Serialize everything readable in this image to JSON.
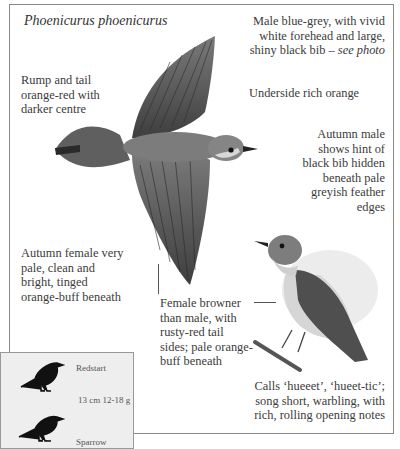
{
  "title": "Phoenicurus phoenicurus",
  "annotations": {
    "rump": [
      "Rump and tail",
      "orange-red with",
      "darker centre"
    ],
    "male": {
      "lines": [
        "Male blue-grey, with vivid",
        "white forehead and large,"
      ],
      "last_line": "shiny black bib – ",
      "see_photo": "see photo"
    },
    "underside": "Underside rich orange",
    "autumn_male": [
      "Autumn male",
      "shows hint of",
      "black bib hidden",
      "beneath pale",
      "greyish feather",
      "edges"
    ],
    "autumn_female": [
      "Autumn female very",
      "pale, clean and",
      "bright, tinged",
      "orange-buff beneath"
    ],
    "female": [
      "Female browner",
      "than male, with",
      "rusty-red tail",
      "sides; pale orange-",
      "buff beneath"
    ],
    "calls": [
      "Calls ‘hueeet’, ‘hueet-tic’;",
      "song short, warbling, with",
      "rich, rolling opening notes"
    ]
  },
  "size_box": {
    "species": "Redstart",
    "measurements": "13 cm  12-18 g",
    "comparison": "Sparrow"
  },
  "colors": {
    "text": "#3b3b3b",
    "frame": "#8a8a8a",
    "inset_bg": "#eeeeee",
    "bird_grey": "#6b6b6b"
  }
}
